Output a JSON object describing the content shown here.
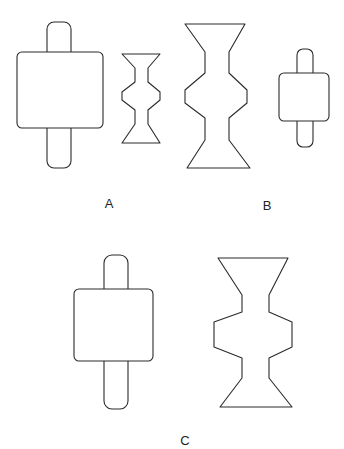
{
  "figure": {
    "groups": [
      {
        "label": "A",
        "label_pos": [
          109,
          203
        ],
        "shapes": [
          {
            "type": "axle-block",
            "rod": [
              47,
              22,
              71,
              168
            ],
            "block": [
              17,
              52,
              103,
              128
            ]
          },
          {
            "type": "spool",
            "top": [
              122,
              54,
              160
            ],
            "waist_x": [
              135,
              148
            ],
            "upper_waist_y": [
              68,
              82
            ],
            "bulge": [
              122,
              160,
              92,
              100
            ],
            "lower_waist_y": [
              110,
              124
            ],
            "bottom": [
              122,
              143,
              160
            ]
          }
        ]
      },
      {
        "label": "B",
        "label_pos": [
          267,
          205
        ],
        "shapes": [
          {
            "type": "spool",
            "top": [
              185,
              24,
              245
            ],
            "waist_x": [
              205,
              229
            ],
            "upper_waist_y": [
              52,
              73
            ],
            "bulge": [
              185,
              247,
              90,
              103
            ],
            "lower_waist_y": [
              118,
              140
            ],
            "bottom": [
              187,
              168,
              250
            ]
          },
          {
            "type": "axle-block",
            "rod": [
              297,
              49,
              313,
              147
            ],
            "block": [
              279,
              73,
              329,
              121
            ]
          }
        ]
      },
      {
        "label": "C",
        "label_pos": [
          185,
          440
        ],
        "shapes": [
          {
            "type": "axle-block",
            "rod": [
              104,
              255,
              128,
              409
            ],
            "block": [
              74,
              289,
              153,
              361
            ]
          },
          {
            "type": "spool",
            "top": [
              218,
              258,
              288
            ],
            "waist_x": [
              242,
              269
            ],
            "upper_waist_y": [
              295,
              312
            ],
            "bulge": [
              214,
              292,
              322,
              347
            ],
            "lower_waist_y": [
              358,
              378
            ],
            "bottom": [
              220,
              407,
              292
            ]
          }
        ]
      }
    ]
  }
}
